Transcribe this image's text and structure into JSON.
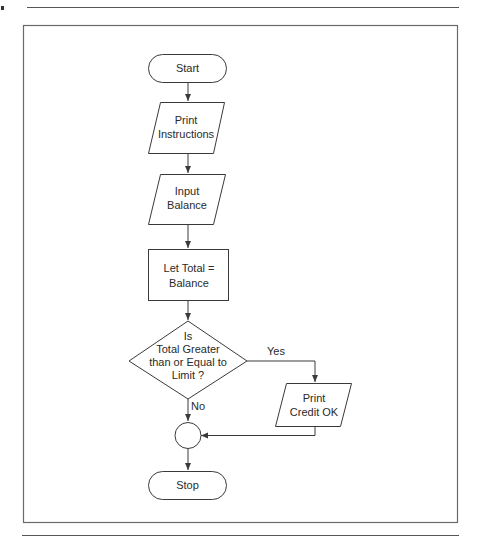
{
  "diagram": {
    "type": "flowchart",
    "colors": {
      "stroke": "#3a3a3a",
      "frame": "#6a6a6a",
      "background": "#ffffff",
      "text": "#2a2a2a"
    },
    "nodes": [
      {
        "id": "start",
        "shape": "terminal",
        "line1": "Start"
      },
      {
        "id": "print_instructions",
        "shape": "parallelogram",
        "line1": "Print",
        "line2": "Instructions"
      },
      {
        "id": "input_balance",
        "shape": "parallelogram",
        "line1": "Input",
        "line2": "Balance"
      },
      {
        "id": "let_total",
        "shape": "rectangle",
        "line1": "Let Total  =",
        "line2": "Balance"
      },
      {
        "id": "decision",
        "shape": "diamond",
        "line1": "Is",
        "line2": "Total Greater",
        "line3": "than or Equal to",
        "line4": "Limit ?"
      },
      {
        "id": "print_credit",
        "shape": "parallelogram",
        "line1": "Print",
        "line2": "Credit OK"
      },
      {
        "id": "connector",
        "shape": "circle"
      },
      {
        "id": "stop",
        "shape": "terminal",
        "line1": "Stop"
      }
    ],
    "edges": [
      {
        "from": "start",
        "to": "print_instructions"
      },
      {
        "from": "print_instructions",
        "to": "input_balance"
      },
      {
        "from": "input_balance",
        "to": "let_total"
      },
      {
        "from": "let_total",
        "to": "decision"
      },
      {
        "from": "decision",
        "to": "print_credit",
        "label": "Yes"
      },
      {
        "from": "decision",
        "to": "connector",
        "label": "No"
      },
      {
        "from": "print_credit",
        "to": "connector"
      },
      {
        "from": "connector",
        "to": "stop"
      }
    ],
    "edge_labels": {
      "yes": "Yes",
      "no": "No"
    }
  }
}
